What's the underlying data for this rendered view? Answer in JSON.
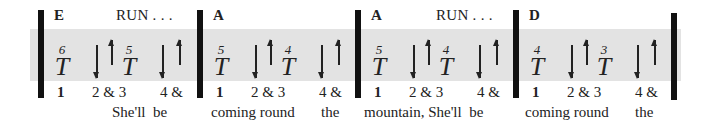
{
  "measures": [
    {
      "chord": "E",
      "annotation": "RUN . . .",
      "thumb_strings": [
        "6",
        "5"
      ],
      "thumb_symbol": "T",
      "counts": [
        "1",
        "2 & 3",
        "4 &"
      ],
      "strums": [
        "down",
        "up",
        "down",
        "up"
      ],
      "lyrics": [
        {
          "text": "She'll  be",
          "x": 55
        }
      ]
    },
    {
      "chord": "A",
      "annotation": "",
      "thumb_strings": [
        "5",
        "4"
      ],
      "thumb_symbol": "T",
      "counts": [
        "1",
        "2 & 3",
        "4 &"
      ],
      "strums": [
        "down",
        "up",
        "down",
        "up"
      ],
      "lyrics": [
        {
          "text": "coming round",
          "x": 8
        },
        {
          "text": "the",
          "x": 118
        }
      ]
    },
    {
      "chord": "A",
      "annotation": "RUN . . .",
      "thumb_strings": [
        "5",
        "4"
      ],
      "thumb_symbol": "T",
      "counts": [
        "1",
        "2 & 3",
        "4 &"
      ],
      "strums": [
        "down",
        "up",
        "down",
        "up"
      ],
      "lyrics": [
        {
          "text": "mountain, She'll  be",
          "x": 3
        }
      ]
    },
    {
      "chord": "D",
      "annotation": "",
      "thumb_strings": [
        "4",
        "3"
      ],
      "thumb_symbol": "T",
      "counts": [
        "1",
        "2 & 3",
        "4 &"
      ],
      "strums": [
        "down",
        "up",
        "down",
        "up"
      ],
      "lyrics": [
        {
          "text": "coming round",
          "x": 6
        },
        {
          "text": "the",
          "x": 116
        }
      ]
    }
  ],
  "colors": {
    "band": "#e3e3e3",
    "bar": "#111111",
    "text": "#222222"
  }
}
